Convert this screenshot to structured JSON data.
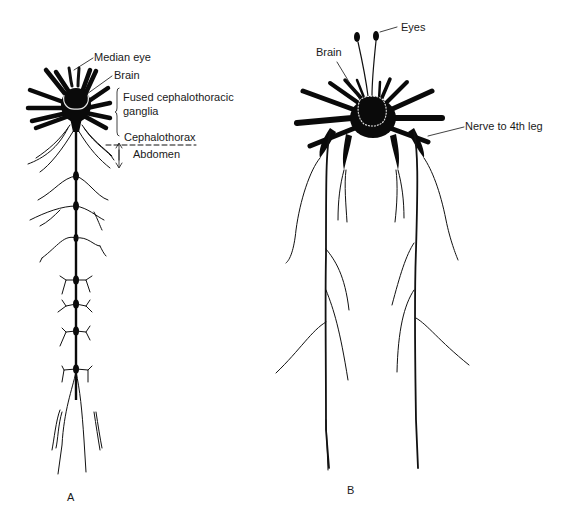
{
  "figure": {
    "panels": [
      {
        "id": "A",
        "label": "A",
        "annotations": {
          "median_eye": "Median eye",
          "brain": "Brain",
          "fused_ganglia_line1": "Fused cephalothoracic",
          "fused_ganglia_line2": "ganglia",
          "cephalothorax": "Cephalothorax",
          "abdomen": "Abdomen"
        }
      },
      {
        "id": "B",
        "label": "B",
        "annotations": {
          "eyes": "Eyes",
          "brain": "Brain",
          "nerve_to_4th_leg": "Nerve to 4th leg"
        }
      }
    ],
    "colors": {
      "ink": "#0a0a0a",
      "background": "#ffffff",
      "brain_outline": "#e8e8e8"
    }
  }
}
